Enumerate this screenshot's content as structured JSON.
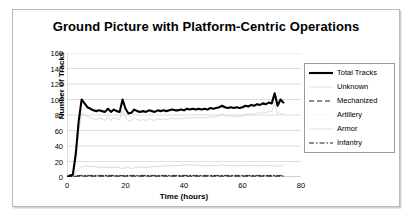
{
  "figure": {
    "title": "Ground Picture with Platform-Centric Operations"
  },
  "legend": {
    "position": "right",
    "items": [
      {
        "label": "Total Tracks",
        "style": "solid-thick",
        "color": "#000000"
      },
      {
        "label": "Unknown",
        "style": "solid-thin",
        "color": "#d2d2d2"
      },
      {
        "label": "Mechanized",
        "style": "dashed",
        "color": "#000000"
      },
      {
        "label": "Artillery",
        "style": "dotted",
        "color": "#e2e2e2"
      },
      {
        "label": "Armor",
        "style": "solid-thin",
        "color": "#cfcfcf"
      },
      {
        "label": "Infantry",
        "style": "dash-dot",
        "color": "#000000"
      }
    ]
  },
  "chart_data": {
    "type": "line",
    "title": "Ground Picture with Platform-Centric Operations",
    "xlabel": "Time (hours)",
    "ylabel": "Number of Tracks",
    "xlim": [
      0,
      80
    ],
    "ylim": [
      0,
      160
    ],
    "xticks": [
      0,
      20,
      40,
      60,
      80
    ],
    "yticks": [
      0,
      20,
      40,
      60,
      80,
      100,
      120,
      140,
      160
    ],
    "grid": "horizontal",
    "x": [
      0,
      1,
      2,
      3,
      4,
      5,
      6,
      7,
      8,
      9,
      10,
      11,
      12,
      13,
      14,
      15,
      16,
      17,
      18,
      19,
      20,
      21,
      22,
      23,
      24,
      25,
      26,
      27,
      28,
      29,
      30,
      31,
      32,
      33,
      34,
      35,
      36,
      37,
      38,
      39,
      40,
      41,
      42,
      43,
      44,
      45,
      46,
      47,
      48,
      49,
      50,
      51,
      52,
      53,
      54,
      55,
      56,
      57,
      58,
      59,
      60,
      61,
      62,
      63,
      64,
      65,
      66,
      67,
      68,
      69,
      70,
      71,
      72,
      73,
      74
    ],
    "series": [
      {
        "name": "Total Tracks",
        "style": "solid-thick",
        "color": "#000000",
        "values": [
          0,
          2,
          3,
          30,
          72,
          100,
          95,
          90,
          88,
          86,
          85,
          86,
          85,
          84,
          88,
          84,
          87,
          85,
          84,
          100,
          88,
          82,
          83,
          87,
          85,
          84,
          85,
          84,
          86,
          85,
          84,
          86,
          85,
          86,
          85,
          86,
          87,
          86,
          86,
          87,
          86,
          88,
          87,
          88,
          87,
          88,
          87,
          88,
          87,
          89,
          88,
          89,
          90,
          92,
          90,
          89,
          90,
          89,
          90,
          89,
          90,
          92,
          91,
          93,
          92,
          94,
          93,
          95,
          94,
          96,
          95,
          108,
          92,
          100,
          96
        ]
      },
      {
        "name": "Unknown",
        "style": "solid-thin",
        "color": "#cccccc",
        "values": [
          0,
          1,
          2,
          22,
          58,
          82,
          80,
          78,
          77,
          75,
          74,
          76,
          75,
          73,
          78,
          73,
          77,
          75,
          74,
          86,
          77,
          72,
          73,
          76,
          74,
          73,
          74,
          73,
          75,
          74,
          73,
          75,
          74,
          75,
          74,
          75,
          76,
          75,
          75,
          76,
          75,
          77,
          76,
          77,
          76,
          77,
          76,
          77,
          76,
          78,
          77,
          78,
          79,
          81,
          79,
          78,
          79,
          78,
          79,
          78,
          79,
          81,
          80,
          82,
          81,
          83,
          82,
          84,
          83,
          85,
          84,
          96,
          81,
          82,
          81
        ]
      },
      {
        "name": "Mechanized",
        "style": "dashed",
        "color": "#111111",
        "values": [
          0,
          0,
          0,
          1,
          1,
          1,
          1,
          1,
          1,
          1,
          1,
          1,
          1,
          1,
          1,
          1,
          1,
          1,
          1,
          1,
          1,
          1,
          1,
          1,
          1,
          1,
          1,
          1,
          1,
          1,
          1,
          1,
          1,
          1,
          1,
          1,
          1,
          1,
          1,
          1,
          1,
          1,
          1,
          1,
          1,
          1,
          1,
          1,
          1,
          1,
          1,
          1,
          1,
          1,
          1,
          1,
          1,
          1,
          1,
          1,
          1,
          1,
          1,
          1,
          1,
          1,
          1,
          1,
          1,
          1,
          1,
          1,
          1,
          1,
          1
        ]
      },
      {
        "name": "Artillery",
        "style": "dotted",
        "color": "#dedede",
        "values": [
          0,
          0,
          0,
          1,
          2,
          2,
          2,
          2,
          2,
          2,
          2,
          2,
          2,
          2,
          2,
          2,
          2,
          2,
          2,
          2,
          2,
          2,
          2,
          2,
          2,
          2,
          2,
          2,
          2,
          2,
          2,
          2,
          2,
          2,
          2,
          2,
          2,
          2,
          2,
          2,
          2,
          2,
          2,
          2,
          2,
          2,
          2,
          2,
          2,
          2,
          2,
          2,
          2,
          2,
          2,
          2,
          2,
          2,
          2,
          2,
          2,
          2,
          2,
          2,
          2,
          2,
          2,
          2,
          2,
          2,
          2,
          2,
          2,
          2,
          2
        ]
      },
      {
        "name": "Armor",
        "style": "solid-thin",
        "color": "#c6c6c6",
        "values": [
          0,
          1,
          1,
          6,
          10,
          13,
          14,
          14,
          13,
          14,
          13,
          12,
          13,
          12,
          13,
          12,
          12,
          13,
          12,
          11,
          12,
          12,
          11,
          12,
          13,
          12,
          13,
          12,
          13,
          13,
          14,
          13,
          14,
          14,
          15,
          14,
          15,
          14,
          15,
          15,
          16,
          15,
          16,
          15,
          16,
          15,
          14,
          15,
          14,
          15,
          14,
          15,
          14,
          16,
          15,
          14,
          15,
          14,
          15,
          14,
          15,
          14,
          15,
          14,
          15,
          14,
          15,
          14,
          15,
          14,
          15,
          14,
          14,
          15,
          14
        ]
      },
      {
        "name": "Infantry",
        "style": "dash-dot",
        "color": "#1a1a1a",
        "values": [
          0,
          0,
          1,
          1,
          2,
          2,
          2,
          2,
          2,
          2,
          2,
          2,
          2,
          2,
          2,
          2,
          2,
          2,
          2,
          2,
          2,
          2,
          2,
          2,
          2,
          2,
          2,
          2,
          2,
          2,
          2,
          2,
          2,
          2,
          2,
          2,
          2,
          2,
          2,
          2,
          2,
          2,
          2,
          2,
          2,
          2,
          2,
          2,
          2,
          2,
          2,
          2,
          2,
          2,
          2,
          2,
          2,
          2,
          2,
          2,
          2,
          2,
          2,
          2,
          2,
          2,
          2,
          2,
          2,
          2,
          2,
          2,
          2,
          2,
          2
        ]
      }
    ]
  }
}
